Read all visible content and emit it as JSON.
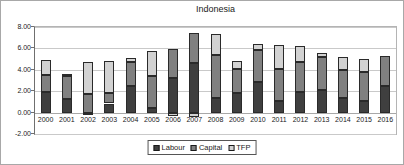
{
  "title": "Indonesia",
  "colors": {
    "labour": "#3F3F3F",
    "capital": "#808080",
    "tfp": "#D2D2D2",
    "gridline": "#C9C9C9",
    "axis": "#6F6F6F"
  },
  "y_axis": {
    "tick_labels": [
      "8.00",
      "6.00",
      "4.00",
      "2.00",
      "0.00",
      "-2.00"
    ],
    "tick_values": [
      8,
      6,
      4,
      2,
      0,
      -2
    ]
  },
  "legend": {
    "items": [
      {
        "label": "Labour",
        "color": "#3F3F3F"
      },
      {
        "label": "Capital",
        "color": "#808080"
      },
      {
        "label": "TFP",
        "color": "#D2D2D2"
      }
    ]
  },
  "chart_data": {
    "type": "bar",
    "stacked": true,
    "title": "Indonesia",
    "categories": [
      "2000",
      "2001",
      "2002",
      "2003",
      "2004",
      "2005",
      "2006",
      "2007",
      "2008",
      "2009",
      "2010",
      "2011",
      "2012",
      "2013",
      "2014",
      "2015",
      "2016"
    ],
    "series": [
      {
        "name": "Labour",
        "values": [
          1.9,
          1.3,
          -0.25,
          0.85,
          2.45,
          0.45,
          3.2,
          4.6,
          1.35,
          1.8,
          2.9,
          1.1,
          1.9,
          2.15,
          1.35,
          1.1,
          2.45
        ]
      },
      {
        "name": "Capital",
        "values": [
          1.6,
          2.1,
          1.7,
          0.95,
          2.25,
          3.0,
          2.7,
          2.85,
          4.0,
          2.3,
          2.95,
          3.0,
          2.85,
          3.0,
          2.65,
          2.65,
          2.8
        ]
      },
      {
        "name": "TFP",
        "values": [
          1.4,
          0.25,
          3.05,
          3.0,
          0.4,
          2.3,
          -0.3,
          -0.45,
          2.0,
          0.7,
          0.6,
          2.2,
          1.45,
          0.45,
          1.2,
          1.3,
          0
        ]
      }
    ],
    "ylim": [
      -2,
      8
    ],
    "ytick_interval": 2,
    "grid": true,
    "legend_position": "bottom",
    "bar_width_px": 10
  }
}
